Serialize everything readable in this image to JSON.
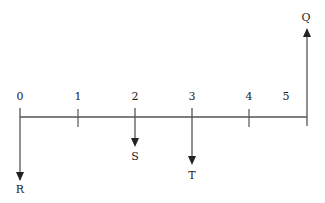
{
  "diagram": {
    "type": "cash-flow-timeline",
    "axis": {
      "tick_labels": [
        "0",
        "1",
        "2",
        "3",
        "4",
        "5"
      ],
      "color": "#555555"
    },
    "flows": [
      {
        "label": "R",
        "period": "0",
        "direction": "down"
      },
      {
        "label": "S",
        "period": "2",
        "direction": "down"
      },
      {
        "label": "T",
        "period": "3",
        "direction": "down"
      },
      {
        "label": "Q",
        "period": "5",
        "direction": "up"
      }
    ]
  }
}
